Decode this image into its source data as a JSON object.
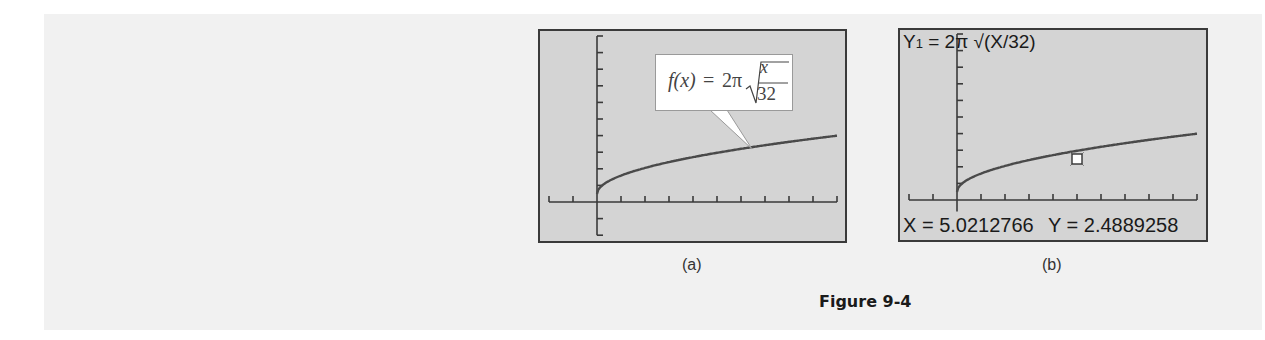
{
  "figure": {
    "caption": "Figure 9-4",
    "panels": [
      {
        "label": "(a)",
        "callout": {
          "fx": "f(x)",
          "equals": "=",
          "coef": "2π",
          "numerator": "x",
          "denominator": "32"
        }
      },
      {
        "label": "(b)",
        "equation": "Y1 = 2π √(X/32)",
        "equation_lhs": "Y",
        "equation_sub": "1",
        "equation_rhs": " = 2π √(X/32)",
        "trace_x": "X = 5.0212766",
        "trace_y": "Y = 2.4889258"
      }
    ]
  },
  "colors": {
    "panel_bg": "#f1f1f1",
    "screen_bg": "#d4d4d4",
    "axis": "#3a3a3a",
    "curve": "#4a4a4a",
    "marker_fill": "#ffffff"
  },
  "chart_data": [
    {
      "type": "line",
      "title": "f(x) = 2π√(x/32)",
      "function": "2*pi*sqrt(x/32)",
      "xlim": [
        -2,
        10
      ],
      "ylim": [
        -2,
        10
      ],
      "x_tick_step": 1,
      "y_tick_step": 1,
      "grid": false,
      "x": [
        0,
        1,
        2,
        3,
        4,
        5,
        6,
        7,
        8,
        9,
        10
      ],
      "series": [
        {
          "name": "f(x)",
          "values": [
            0,
            1.11,
            1.57,
            1.92,
            2.22,
            2.48,
            2.72,
            2.94,
            3.14,
            3.33,
            3.51
          ]
        }
      ],
      "annotations": [
        "f(x) = 2π √(x/32)"
      ],
      "panel": "(a)"
    },
    {
      "type": "line",
      "title": "Y1 = 2π √(X/32)",
      "function": "2*pi*sqrt(X/32)",
      "xlim": [
        -2,
        10
      ],
      "ylim": [
        -2,
        10
      ],
      "x_tick_step": 1,
      "y_tick_step": 1,
      "grid": false,
      "x": [
        0,
        1,
        2,
        3,
        4,
        5,
        6,
        7,
        8,
        9,
        10
      ],
      "series": [
        {
          "name": "Y1",
          "values": [
            0,
            1.11,
            1.57,
            1.92,
            2.22,
            2.48,
            2.72,
            2.94,
            3.14,
            3.33,
            3.51
          ]
        }
      ],
      "trace_point": {
        "x": 5.0212766,
        "y": 2.4889258
      },
      "annotations": [
        "X = 5.0212766",
        "Y = 2.4889258"
      ],
      "panel": "(b)"
    }
  ]
}
